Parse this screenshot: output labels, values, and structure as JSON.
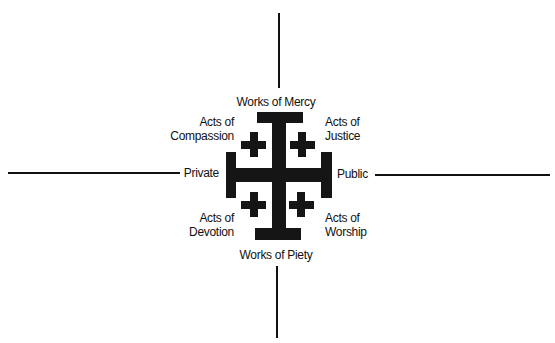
{
  "diagram": {
    "title": "",
    "center_symbol": "jerusalem-cross",
    "colors": {
      "background": "#ffffff",
      "ink": "#151515"
    },
    "axes": {
      "vertical": {
        "top_label": "Works of Mercy",
        "bottom_label": "Works of Piety"
      },
      "horizontal": {
        "left_label": "Private",
        "right_label": "Public"
      }
    },
    "quadrants": {
      "top_left": {
        "line1": "Acts of",
        "line2": "Compassion"
      },
      "top_right": {
        "line1": "Acts of",
        "line2": "Justice"
      },
      "bottom_left": {
        "line1": "Acts of",
        "line2": "Devotion"
      },
      "bottom_right": {
        "line1": "Acts of",
        "line2": "Worship"
      }
    }
  }
}
